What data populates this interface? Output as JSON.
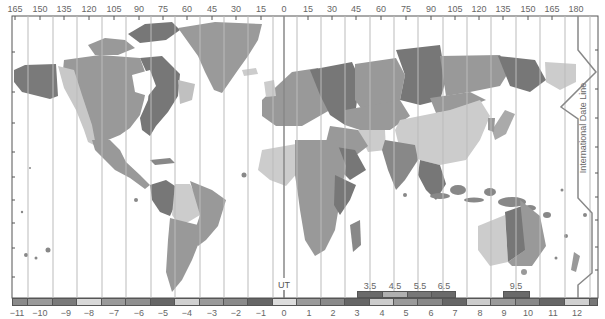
{
  "map": {
    "type": "world time zone map",
    "ut_label": "UT",
    "date_line_label": "International Date Line",
    "colors": {
      "ocean": "#ffffff",
      "frame": "#555555",
      "meridian": "#bbbbbb",
      "ut_line": "#888888",
      "date_line": "#888888",
      "light": "#cccccc",
      "mid": "#999999",
      "mid2": "#8a8a8a",
      "dark": "#6f6f6f"
    }
  },
  "longitude_labels": [
    "165",
    "150",
    "135",
    "120",
    "105",
    "90",
    "75",
    "60",
    "45",
    "30",
    "15",
    "0",
    "15",
    "30",
    "45",
    "60",
    "75",
    "90",
    "105",
    "120",
    "135",
    "150",
    "165",
    "180"
  ],
  "zone_band": {
    "labels": [
      "−11",
      "−10",
      "−9",
      "−8",
      "−7",
      "−6",
      "−5",
      "−4",
      "−3",
      "−2",
      "−1",
      "0",
      "1",
      "2",
      "3",
      "4",
      "5",
      "6",
      "7",
      "8",
      "9",
      "10",
      "11",
      "12"
    ],
    "cell_colors": [
      "#8a8a8a",
      "#9a9a9a",
      "#7a7a7a",
      "#d8d8d8",
      "#9a9a9a",
      "#8f8f8f",
      "#666666",
      "#d0d0d0",
      "#9a9a9a",
      "#8a8a8a",
      "#666666",
      "#dddddd",
      "#9a9a9a",
      "#8a8a8a",
      "#666666",
      "#cccccc",
      "#9a9a9a",
      "#888888",
      "#666666",
      "#cccccc",
      "#9a9a9a",
      "#888888",
      "#666666",
      "#d0d0d0",
      "#777777"
    ]
  },
  "half_hour_zones": [
    {
      "label": "3.5",
      "color": "#6a6a6a"
    },
    {
      "label": "4.5",
      "color": "#b0b0b0"
    },
    {
      "label": "5.5",
      "color": "#777777"
    },
    {
      "label": "6.5",
      "color": "#6a6a6a"
    },
    {
      "label": "9.5",
      "color": "#6a6a6a"
    }
  ]
}
